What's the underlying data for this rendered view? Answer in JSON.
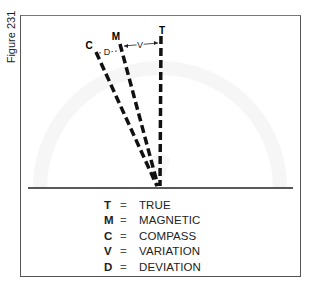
{
  "figure": {
    "label": "Figure 231"
  },
  "diagram": {
    "lines": [
      {
        "key": "T",
        "label": "T"
      },
      {
        "key": "M",
        "label": "M"
      },
      {
        "key": "C",
        "label": "C"
      }
    ],
    "arcs": {
      "deviation_label": "D",
      "variation_label": "V"
    }
  },
  "legend": [
    {
      "key": "T",
      "eq": "=",
      "value": "TRUE"
    },
    {
      "key": "M",
      "eq": "=",
      "value": "MAGNETIC"
    },
    {
      "key": "C",
      "eq": "=",
      "value": "COMPASS"
    },
    {
      "key": "V",
      "eq": "=",
      "value": "VARIATION"
    },
    {
      "key": "D",
      "eq": "=",
      "value": "DEVIATION"
    }
  ]
}
